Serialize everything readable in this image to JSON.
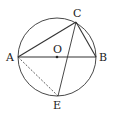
{
  "figure": {
    "type": "geometry",
    "colors": {
      "stroke": "#333333",
      "background": "#ffffff"
    },
    "circle": {
      "center": "O",
      "cx": 57,
      "cy": 57,
      "r": 39
    },
    "points": {
      "A": {
        "label": "A",
        "x": 18,
        "y": 57
      },
      "B": {
        "label": "B",
        "x": 96,
        "y": 57
      },
      "C": {
        "label": "C",
        "x": 76,
        "y": 22
      },
      "E": {
        "label": "E",
        "x": 58,
        "y": 96
      },
      "O": {
        "label": "O",
        "x": 57,
        "y": 57
      }
    },
    "segments": [
      {
        "from": "A",
        "to": "B",
        "style": "solid"
      },
      {
        "from": "A",
        "to": "C",
        "style": "solid"
      },
      {
        "from": "C",
        "to": "B",
        "style": "solid"
      },
      {
        "from": "C",
        "to": "E",
        "style": "solid"
      },
      {
        "from": "A",
        "to": "E",
        "style": "dashed"
      }
    ]
  }
}
